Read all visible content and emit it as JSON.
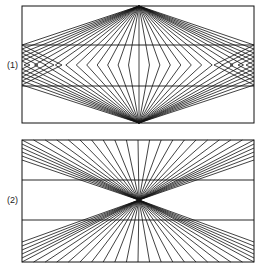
{
  "figures": [
    {
      "label": "(1)",
      "box": {
        "x1": 22,
        "y1": 6,
        "x2": 254,
        "y2": 123
      },
      "hlines": [
        45,
        86
      ],
      "apex_top": [
        139,
        6
      ],
      "apex_bottom": [
        139,
        123
      ],
      "mid_y": 65,
      "type": "diamond"
    },
    {
      "label": "(2)",
      "box": {
        "x1": 22,
        "y1": 140,
        "x2": 254,
        "y2": 262
      },
      "hlines": [
        180,
        220
      ],
      "center": [
        139,
        200
      ],
      "type": "hourglass"
    }
  ],
  "line_count": 21,
  "color": "#111111"
}
